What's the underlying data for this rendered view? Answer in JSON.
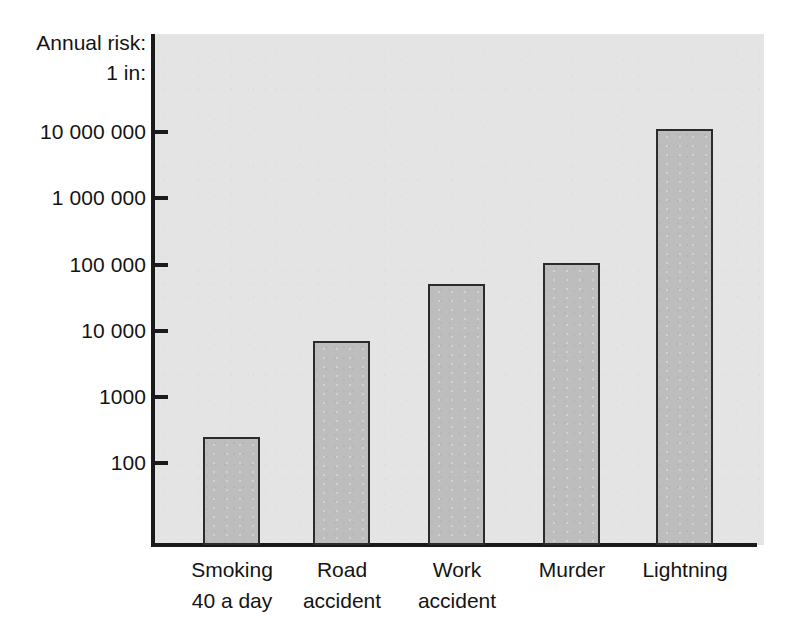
{
  "chart_data": {
    "type": "bar",
    "title": "",
    "subtitle": "",
    "xlabel": "",
    "ylabel": "Annual risk: 1 in:",
    "ylabel_lines": [
      "Annual risk:",
      "1 in:"
    ],
    "yscale": "log",
    "ylim": [
      100,
      20000000
    ],
    "ytick_labels": [
      "10 000 000",
      "1 000 000",
      "100 000",
      "10 000",
      "1000",
      "100"
    ],
    "ytick_values": [
      10000000,
      1000000,
      100000,
      10000,
      1000,
      100
    ],
    "grid": false,
    "legend": false,
    "categories": [
      "Smoking 40 a day",
      "Road accident",
      "Work accident",
      "Murder",
      "Lightning"
    ],
    "category_lines": [
      [
        "Smoking",
        "40 a day"
      ],
      [
        "Road",
        "accident"
      ],
      [
        "Work",
        "accident"
      ],
      [
        "Murder",
        ""
      ],
      [
        "Lightning",
        ""
      ]
    ],
    "values": [
      250,
      7000,
      50000,
      105000,
      11000000
    ],
    "value_labels": [
      "250",
      "7000",
      "50 000",
      "105 000",
      "11 000 000"
    ],
    "series": [
      {
        "name": "Annual risk (1 in N)",
        "values": [
          250,
          7000,
          50000,
          105000,
          11000000
        ]
      }
    ]
  },
  "colors": {
    "bar_fill": "#bdbdbd",
    "bar_stroke": "#2b2b2b",
    "panel_background": "#e4e4e4",
    "page_background": "#ffffff",
    "axis": "#1a1a1a",
    "text": "#141414"
  }
}
